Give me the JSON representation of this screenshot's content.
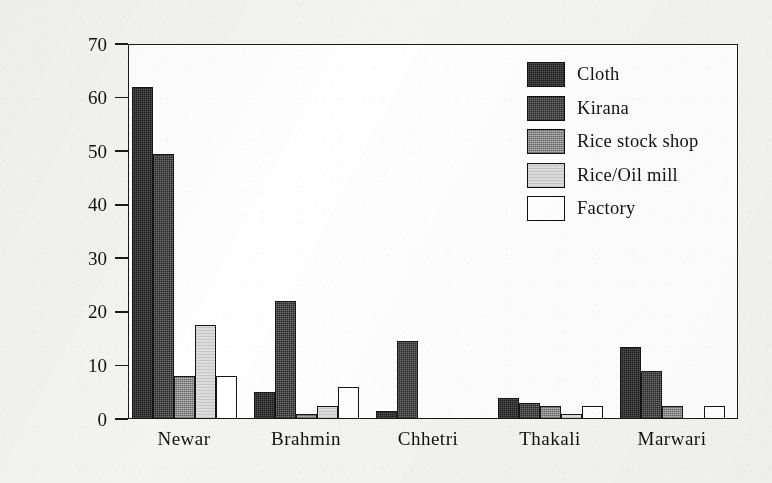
{
  "chart_data": {
    "type": "bar",
    "title": "",
    "xlabel": "",
    "ylabel": "Number of  Businesses",
    "ylim": [
      0,
      70
    ],
    "yticks": [
      0,
      10,
      20,
      30,
      40,
      50,
      60,
      70
    ],
    "grid": false,
    "legend_position": "inside top-right",
    "categories": [
      "Newar",
      "Brahmin",
      "Chhetri",
      "Thakali",
      "Marwari"
    ],
    "series": [
      {
        "name": "Cloth",
        "values": [
          62,
          5,
          1.5,
          4,
          13.5
        ]
      },
      {
        "name": "Kirana",
        "values": [
          49.5,
          22,
          14.5,
          3,
          9
        ]
      },
      {
        "name": "Rice stock shop",
        "values": [
          8,
          1,
          0,
          2.5,
          2.5
        ]
      },
      {
        "name": "Rice/Oil mill",
        "values": [
          17.5,
          2.5,
          0,
          1,
          0
        ]
      },
      {
        "name": "Factory",
        "values": [
          8,
          6,
          0,
          2.5,
          2.5
        ]
      }
    ],
    "series_colors": [
      "#1e1e1e",
      "#4a4a4a",
      "#9a9a9a",
      "#dcdcdc",
      "#ffffff"
    ]
  },
  "axis": {
    "y_title": "Number of  Businesses",
    "tick_labels": [
      "70",
      "60",
      "50",
      "40",
      "30",
      "20",
      "10",
      "0"
    ]
  },
  "legend": {
    "items": [
      {
        "label": "Cloth"
      },
      {
        "label": "Kirana"
      },
      {
        "label": "Rice stock shop"
      },
      {
        "label": "Rice/Oil mill"
      },
      {
        "label": "Factory"
      }
    ]
  }
}
